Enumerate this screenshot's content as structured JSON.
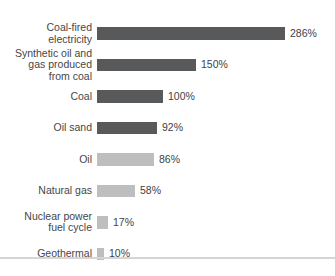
{
  "chart_data": {
    "type": "bar",
    "orientation": "horizontal",
    "title": "",
    "xlabel": "",
    "ylabel": "",
    "unit": "%",
    "xlim": [
      0,
      286
    ],
    "grid": false,
    "legend": false,
    "categories": [
      "Coal-fired electricity",
      "Synthetic oil and gas produced from coal",
      "Coal",
      "Oil sand",
      "Oil",
      "Natural gas",
      "Nuclear power fuel cycle",
      "Geothermal"
    ],
    "values": [
      286,
      150,
      100,
      92,
      86,
      58,
      17,
      10
    ],
    "value_labels": [
      "286%",
      "150%",
      "100%",
      "92%",
      "86%",
      "58%",
      "17%",
      "10%"
    ],
    "label_linebreaks": [
      "Coal-fired\nelectricity",
      "Synthetic oil and\ngas produced\nfrom coal",
      "Coal",
      "Oil sand",
      "Oil",
      "Natural gas",
      "Nuclear power\nfuel cycle",
      "Geothermal"
    ],
    "bar_shades": [
      "dark",
      "dark",
      "dark",
      "dark",
      "light",
      "light",
      "light",
      "light"
    ]
  },
  "colors": {
    "bar_dark": "#58595b",
    "bar_light": "#bcbec0",
    "category_text": "#454649",
    "value_text": "#414245",
    "divider": "#d4d5d7",
    "background": "#ffffff"
  }
}
